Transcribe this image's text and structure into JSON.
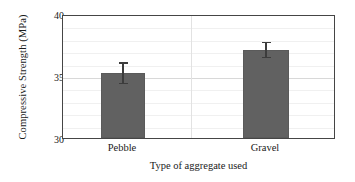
{
  "chart_data": {
    "type": "bar",
    "title": "",
    "subtitle": "",
    "xlabel": "Type of aggregate used",
    "ylabel": "Compressive Strength (MPa)",
    "categories": [
      "Pebble",
      "Gravel"
    ],
    "values": [
      35.3,
      37.2
    ],
    "errors": [
      0.9,
      0.65
    ],
    "ylim": [
      30,
      40
    ],
    "yticks": [
      30,
      35,
      40
    ],
    "ytick_labels": [
      "30",
      "35",
      "40"
    ],
    "y_minor_step": 1,
    "grid": "horizontal-major-and-minor, faint vertical category separator",
    "legend": "none",
    "bar_color": "#616161",
    "error_color": "#3c3c3c",
    "frame_color": "#454545",
    "grid_color": "#d8d8d8",
    "background": "#ffffff",
    "annotations": []
  },
  "axes": {
    "y": {
      "title": "Compressive Strength (MPa)",
      "ticks": [
        {
          "label": "40",
          "value": 40
        },
        {
          "label": "35",
          "value": 35
        },
        {
          "label": "30",
          "value": 30
        }
      ]
    },
    "x": {
      "title": "Type of aggregate used",
      "ticks": [
        {
          "label": "Pebble"
        },
        {
          "label": "Gravel"
        }
      ]
    }
  }
}
